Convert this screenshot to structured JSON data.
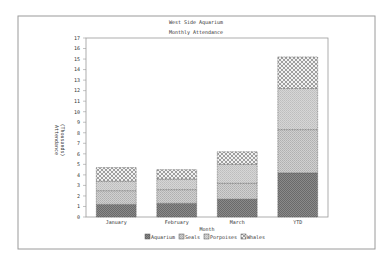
{
  "chart_data": {
    "type": "bar",
    "stacked": true,
    "title": "West Side Aquarium",
    "subtitle": "Monthly Attendance",
    "xlabel": "Month",
    "ylabel": "Attendance\n(Thousands)",
    "ylabel_lines": [
      "Attendance",
      "(Thousands)"
    ],
    "ylim": [
      0,
      17
    ],
    "yticks": [
      0,
      1,
      2,
      3,
      4,
      5,
      6,
      7,
      8,
      9,
      10,
      11,
      12,
      13,
      14,
      15,
      16,
      17
    ],
    "categories": [
      "January",
      "February",
      "March",
      "YTD"
    ],
    "series": [
      {
        "name": "Aquarium",
        "values": [
          1.2,
          1.3,
          1.7,
          4.2
        ]
      },
      {
        "name": "Seals",
        "values": [
          1.3,
          1.3,
          1.5,
          4.1
        ]
      },
      {
        "name": "Porpoises",
        "values": [
          0.9,
          1.0,
          1.8,
          3.9
        ]
      },
      {
        "name": "Whales",
        "values": [
          1.3,
          0.9,
          1.2,
          3.0
        ]
      }
    ],
    "legend": {
      "position": "bottom"
    },
    "grid": false
  }
}
